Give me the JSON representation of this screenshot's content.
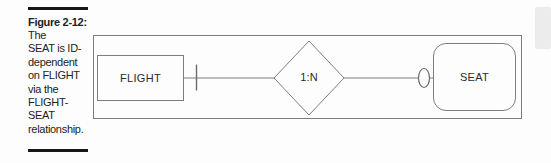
{
  "caption": {
    "title": "Figure 2-12:",
    "lines": [
      "The",
      "SEAT is ID-",
      "dependent",
      "on FLIGHT",
      "via the",
      "FLIGHT-",
      "SEAT",
      "relationship."
    ]
  },
  "diagram": {
    "entities": [
      {
        "label": "FLIGHT",
        "shape": "rectangle"
      },
      {
        "label": "SEAT",
        "shape": "rounded-rectangle"
      }
    ],
    "relationship": {
      "label": "1:N",
      "shape": "diamond"
    },
    "connector": {
      "flight_end_symbol": "one-cardinality-tick",
      "seat_end_symbol": "ellipse"
    },
    "colors": {
      "line": "#7d7d7d",
      "text": "#2b2b2b",
      "caption_bar": "#161616",
      "scan_artifact": "#ececec",
      "background": "#fdfdfd"
    }
  }
}
